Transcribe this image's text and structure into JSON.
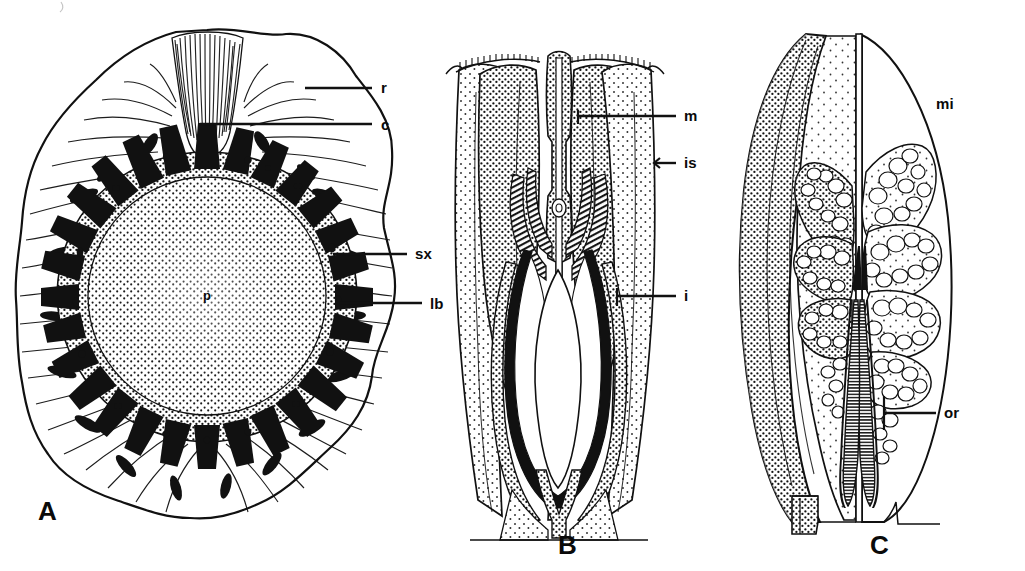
{
  "figure": {
    "kind": "botanical-line-drawing-plate",
    "panel_count": 3,
    "ink_color": "#111111",
    "background_color": "#ffffff"
  },
  "panels": [
    {
      "letter": "A",
      "letter_x": 38,
      "letter_y": 498,
      "caption_type": "transverse-section",
      "labels": [
        {
          "key": "r",
          "text": "r",
          "x": 381,
          "y": 80,
          "lead_x1": 305,
          "lead_x2": 372,
          "lead_y": 88
        },
        {
          "key": "c",
          "text": "c",
          "x": 381,
          "y": 117,
          "lead_x1": 200,
          "lead_x2": 372,
          "lead_y": 124
        },
        {
          "key": "sx",
          "text": "sx",
          "x": 415,
          "y": 246,
          "lead_x1": 333,
          "lead_x2": 407,
          "lead_y": 254
        },
        {
          "key": "lb",
          "text": "lb",
          "x": 430,
          "y": 296,
          "lead_x1": 340,
          "lead_x2": 422,
          "lead_y": 303
        },
        {
          "key": "p",
          "text": "p",
          "x": 207,
          "y": 294,
          "lead_x1": 0,
          "lead_x2": 0,
          "lead_y": 0
        }
      ]
    },
    {
      "letter": "B",
      "letter_x": 558,
      "letter_y": 532,
      "caption_type": "longitudinal-section-ovule",
      "labels": [
        {
          "key": "m",
          "text": "m",
          "x": 684,
          "y": 108,
          "lead_x1": 578,
          "lead_x2": 676,
          "lead_y": 116
        },
        {
          "key": "is",
          "text": "is",
          "x": 684,
          "y": 155,
          "lead_x1": 654,
          "lead_x2": 676,
          "lead_y": 163
        },
        {
          "key": "i",
          "text": "i",
          "x": 684,
          "y": 288,
          "lead_x1": 617,
          "lead_x2": 676,
          "lead_y": 296
        }
      ]
    },
    {
      "letter": "C",
      "letter_x": 870,
      "letter_y": 532,
      "caption_type": "microsporangiate-structure",
      "labels": [
        {
          "key": "mi",
          "text": "mi",
          "x": 936,
          "y": 96,
          "lead_x1": 0,
          "lead_x2": 0,
          "lead_y": 0
        },
        {
          "key": "or",
          "text": "or",
          "x": 944,
          "y": 405,
          "lead_x1": 884,
          "lead_x2": 936,
          "lead_y": 413
        }
      ]
    }
  ],
  "label_glossary": {
    "r": "rind",
    "c": "cortex",
    "sx": "secondary xylem",
    "lb": "leaf bundle",
    "p": "pith",
    "m": "micropyle",
    "is": "integument surface",
    "i": "integument",
    "mi": "microsporangium",
    "or": "organ axis / receptacle"
  }
}
